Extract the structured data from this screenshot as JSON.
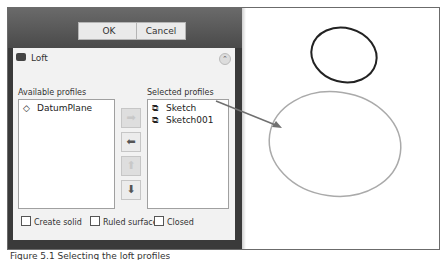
{
  "dialog_buttons": {
    "ok": "OK",
    "cancel": "Cancel"
  },
  "panel": {
    "title": "Loft",
    "collapse_icon": "chevron-up-double",
    "available_label": "Available profiles",
    "selected_label": "Selected profiles",
    "available": [
      {
        "label": "DatumPlane",
        "icon": "datum-plane-icon"
      }
    ],
    "selected": [
      {
        "label": "Sketch",
        "icon": "sketch-icon"
      },
      {
        "label": "Sketch001",
        "icon": "sketch-icon"
      }
    ],
    "move_buttons": [
      {
        "name": "add-profile",
        "glyph": "➡"
      },
      {
        "name": "remove-profile",
        "glyph": "⬅"
      },
      {
        "name": "move-up",
        "glyph": "⬆"
      },
      {
        "name": "move-down",
        "glyph": "⬇"
      }
    ],
    "checkboxes": [
      {
        "label": "Create solid",
        "checked": false
      },
      {
        "label": "Ruled surface",
        "checked": false
      },
      {
        "label": "Closed",
        "checked": false
      }
    ]
  },
  "canvas": {
    "shapes": [
      {
        "type": "ellipse",
        "name": "sketch-small-ellipse",
        "stroke": "#222222"
      },
      {
        "type": "ellipse",
        "name": "sketch001-large-ellipse",
        "stroke": "#aaaaaa"
      },
      {
        "type": "arrow",
        "name": "callout-arrow",
        "stroke": "#707070"
      }
    ]
  },
  "caption": "Figure 5.1 Selecting the loft profiles"
}
